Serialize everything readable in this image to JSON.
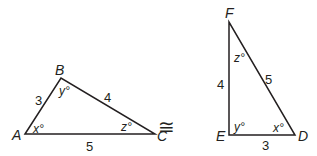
{
  "triangle_abc": {
    "vertices": {
      "A": "A",
      "B": "B",
      "C": "C"
    },
    "sides": {
      "AB": "3",
      "BC": "4",
      "AC": "5"
    },
    "angles": {
      "A": "x°",
      "B": "y°",
      "C": "z°"
    }
  },
  "congruence_symbol": "≅",
  "triangle_def": {
    "vertices": {
      "D": "D",
      "E": "E",
      "F": "F"
    },
    "sides": {
      "EF": "4",
      "FD": "5",
      "ED": "3"
    },
    "angles": {
      "D": "x°",
      "E": "y°",
      "F": "z°"
    }
  },
  "colors": {
    "stroke": "#231f20",
    "background": "#ffffff"
  }
}
